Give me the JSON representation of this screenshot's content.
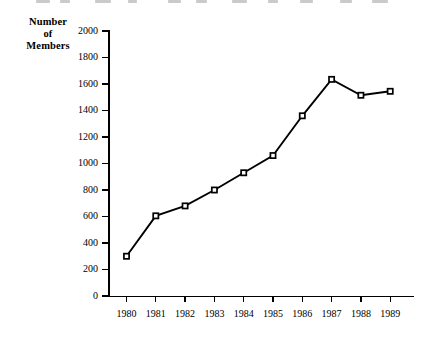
{
  "figure": {
    "y_axis_title_lines": [
      "Number",
      "of",
      "Members"
    ]
  },
  "chart_data": {
    "type": "line",
    "title": "",
    "subtitle": "",
    "xlabel": "",
    "ylabel": "Number of Members",
    "categories": [
      "1980",
      "1981",
      "1982",
      "1983",
      "1984",
      "1985",
      "1986",
      "1987",
      "1988",
      "1989"
    ],
    "values": [
      300,
      605,
      680,
      800,
      930,
      1060,
      1360,
      1635,
      1515,
      1545
    ],
    "ylim": [
      0,
      2000
    ],
    "ytick_labels": [
      "0",
      "200",
      "400",
      "600",
      "800",
      "1000",
      "1200",
      "1400",
      "1600",
      "1800",
      "2000"
    ],
    "ytick_values": [
      0,
      200,
      400,
      600,
      800,
      1000,
      1200,
      1400,
      1600,
      1800,
      2000
    ],
    "xtick_labels": [
      "1980",
      "1981",
      "1982",
      "1983",
      "1984",
      "1985",
      "1986",
      "1987",
      "1988",
      "1989"
    ],
    "grid": false,
    "legend": false,
    "legend_position": "none",
    "marker": "square",
    "series_color": "#000000",
    "background_color": "#ffffff",
    "annotations": []
  }
}
